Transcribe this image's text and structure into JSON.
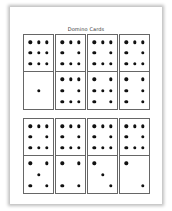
{
  "document": {
    "title": "Domino Cards"
  },
  "rows": [
    {
      "dominoes": [
        {
          "top": 9,
          "bottom": 1
        },
        {
          "top": 8,
          "bottom": 8
        },
        {
          "top": 8,
          "bottom": 7
        },
        {
          "top": 8,
          "bottom": 6
        }
      ]
    },
    {
      "dominoes": [
        {
          "top": 8,
          "bottom": 5
        },
        {
          "top": 8,
          "bottom": 4
        },
        {
          "top": 8,
          "bottom": 3
        },
        {
          "top": 8,
          "bottom": 2
        }
      ]
    }
  ],
  "colors": {
    "pip": "#111111",
    "border": "#666666",
    "page": "#ffffff"
  }
}
